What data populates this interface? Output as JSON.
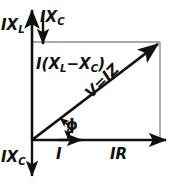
{
  "diagram": {
    "type": "phasor-vector-diagram",
    "colors": {
      "vector_stroke": "#111111",
      "construction_stroke": "#8d8d8d",
      "background": "#ffffff",
      "text": "#111111"
    },
    "labels": {
      "inductive_reactance": "IX",
      "inductive_reactance_sub": "L",
      "capacitive_reactance_top": "IX",
      "capacitive_reactance_top_sub": "C",
      "capacitive_reactance_bottom": "IX",
      "capacitive_reactance_bottom_sub": "C",
      "net_reactance_prefix": "I(X",
      "net_reactance_sub1": "L",
      "net_reactance_middle": "−X",
      "net_reactance_sub2": "C",
      "net_reactance_suffix": ")",
      "current": "I",
      "resistive_drop": "IR",
      "phase_angle": "ϕ",
      "voltage": "V=IZ"
    },
    "geometry": {
      "origin_x": 32,
      "origin_y": 140,
      "top_y": 42,
      "right_x": 160,
      "current_arrow_x": 80,
      "axis_top_y": 6,
      "axis_bottom_y": 181,
      "phase_angle_degrees": 37
    }
  }
}
